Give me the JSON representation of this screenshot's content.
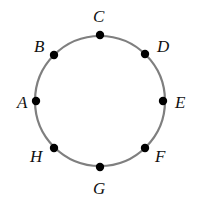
{
  "diagram": {
    "type": "circle-with-points",
    "circle": {
      "cx": 100,
      "cy": 101,
      "r": 65,
      "stroke": "#7f7f7f"
    },
    "points": [
      {
        "label": "A",
        "x": 36,
        "y": 101,
        "lx": 17,
        "ly": 108
      },
      {
        "label": "B",
        "x": 54,
        "y": 55,
        "lx": 34,
        "ly": 52
      },
      {
        "label": "C",
        "x": 100,
        "y": 35,
        "lx": 93,
        "ly": 22
      },
      {
        "label": "D",
        "x": 145,
        "y": 54,
        "lx": 157,
        "ly": 52
      },
      {
        "label": "E",
        "x": 163,
        "y": 101,
        "lx": 175,
        "ly": 108
      },
      {
        "label": "F",
        "x": 145,
        "y": 148,
        "lx": 155,
        "ly": 162
      },
      {
        "label": "G",
        "x": 100,
        "y": 167,
        "lx": 93,
        "ly": 194
      },
      {
        "label": "H",
        "x": 54,
        "y": 148,
        "lx": 30,
        "ly": 162
      }
    ]
  }
}
